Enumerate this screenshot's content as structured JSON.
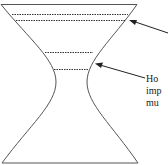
{
  "diagram": {
    "shape": "hourglass / hyperboloid vessel",
    "label_lines": [
      "Ho",
      "imp",
      "mu"
    ],
    "colors": {
      "outline": "#555555",
      "dashes": "#333333",
      "text": "#222222"
    }
  }
}
